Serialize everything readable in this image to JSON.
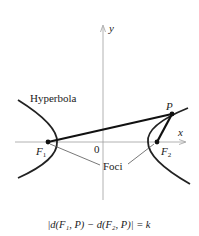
{
  "diagram": {
    "title": "Hyperbola",
    "axes": {
      "x_label": "x",
      "y_label": "y",
      "origin_label": "0"
    },
    "points": {
      "focus1": {
        "label": "F",
        "subscript": "1"
      },
      "focus2": {
        "label": "F",
        "subscript": "2"
      },
      "point_p": {
        "label": "P"
      }
    },
    "annotations": {
      "curve_label": "Hyperbola",
      "foci_label": "Foci"
    },
    "formula": "|d(F₁, P) − d(F₂, P)| = k",
    "colors": {
      "curve": "#222222",
      "axis": "#9a9a9a",
      "leader": "#555555"
    }
  }
}
